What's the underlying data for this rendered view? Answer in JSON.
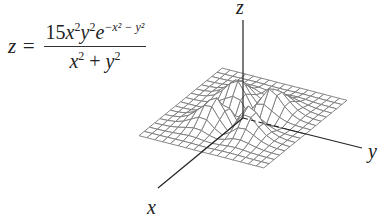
{
  "formula": {
    "lhs": "z =",
    "numerator": "15x²y²e^(−x² − y²)",
    "numerator_parts": {
      "coef": "15",
      "x": "x",
      "x_exp": "2",
      "y": "y",
      "y_exp": "2",
      "e": "e",
      "exp": "−x² − y²"
    },
    "denominator_parts": {
      "x": "x",
      "x_exp": "2",
      "plus": " + ",
      "y": "y",
      "y_exp": "2"
    }
  },
  "axes": {
    "x_label": "x",
    "y_label": "y",
    "z_label": "z"
  },
  "surface": {
    "function": "15*x^2*y^2*exp(-x^2-y^2)/(x^2+y^2)",
    "grid_size": 17,
    "range": [
      -2.6,
      2.6
    ],
    "line_color": "#7a7a7a",
    "axis_color": "#222222"
  }
}
